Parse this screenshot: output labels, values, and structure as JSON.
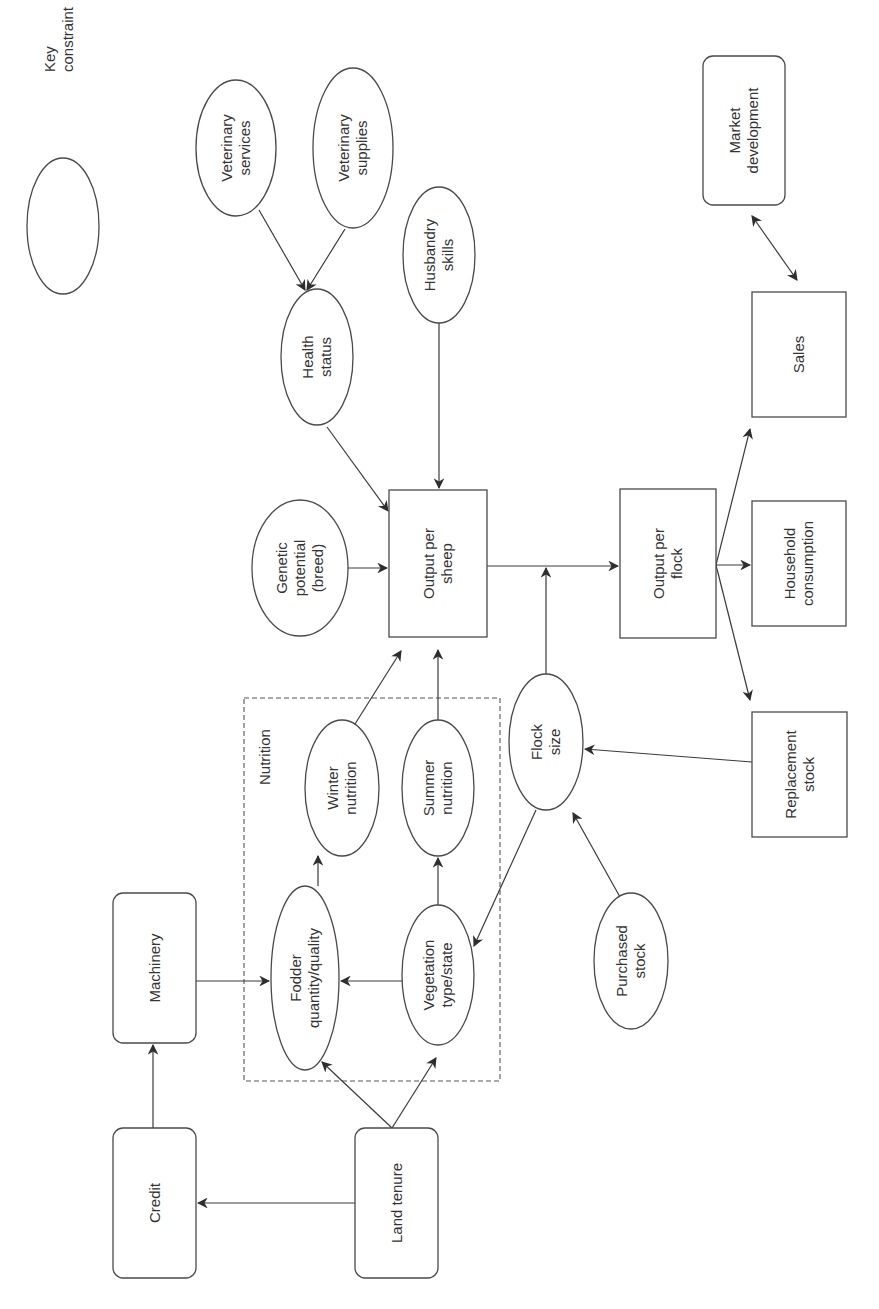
{
  "diagram": {
    "orientation": "rotated -90deg (landscape figure printed on portrait page)",
    "legend": {
      "shape": "ellipse",
      "lines": [
        "Key",
        "constraint"
      ]
    },
    "group": {
      "label": "Nutrition",
      "style": "dashed"
    },
    "nodes": [
      {
        "id": "credit",
        "shape": "roundrect",
        "lines": [
          "Credit"
        ],
        "x": 113,
        "y": 1128,
        "w": 83,
        "h": 150
      },
      {
        "id": "land-tenure",
        "shape": "roundrect",
        "lines": [
          "Land tenure"
        ],
        "x": 355,
        "y": 1128,
        "w": 83,
        "h": 150
      },
      {
        "id": "machinery",
        "shape": "roundrect",
        "lines": [
          "Machinery"
        ],
        "x": 113,
        "y": 893,
        "w": 83,
        "h": 150
      },
      {
        "id": "fodder",
        "shape": "ellipse",
        "lines": [
          "Fodder",
          "quantity/quality"
        ],
        "cx": 305,
        "cy": 978,
        "rx": 34,
        "ry": 92
      },
      {
        "id": "vegetation",
        "shape": "ellipse",
        "lines": [
          "Vegetation",
          "type/state"
        ],
        "cx": 438,
        "cy": 975,
        "rx": 36,
        "ry": 70
      },
      {
        "id": "winter-nutrition",
        "shape": "ellipse",
        "lines": [
          "Winter",
          "nutrition"
        ],
        "cx": 342,
        "cy": 788,
        "rx": 37,
        "ry": 68
      },
      {
        "id": "summer-nutrition",
        "shape": "ellipse",
        "lines": [
          "Summer",
          "nutrition"
        ],
        "cx": 438,
        "cy": 788,
        "rx": 36,
        "ry": 68
      },
      {
        "id": "flock-size",
        "shape": "ellipse",
        "lines": [
          "Flock",
          "size"
        ],
        "cx": 546,
        "cy": 742,
        "rx": 37,
        "ry": 68
      },
      {
        "id": "purchased-stock",
        "shape": "ellipse",
        "lines": [
          "Purchased",
          "stock"
        ],
        "cx": 631,
        "cy": 961,
        "rx": 37,
        "ry": 68
      },
      {
        "id": "replacement-stock",
        "shape": "rect",
        "lines": [
          "Replacement",
          "stock"
        ],
        "x": 752,
        "y": 712,
        "w": 95,
        "h": 125
      },
      {
        "id": "output-per-sheep",
        "shape": "rect",
        "lines": [
          "Output per",
          "sheep"
        ],
        "x": 389,
        "y": 490,
        "w": 98,
        "h": 147
      },
      {
        "id": "genetic-potential",
        "shape": "ellipse",
        "lines": [
          "Genetic",
          "potential",
          "(breed)"
        ],
        "cx": 300,
        "cy": 568,
        "rx": 48,
        "ry": 68
      },
      {
        "id": "health-status",
        "shape": "ellipse",
        "lines": [
          "Health",
          "status"
        ],
        "cx": 317,
        "cy": 357,
        "rx": 36,
        "ry": 68
      },
      {
        "id": "husbandry-skills",
        "shape": "ellipse",
        "lines": [
          "Husbandry",
          "skills"
        ],
        "cx": 439,
        "cy": 255,
        "rx": 36,
        "ry": 68
      },
      {
        "id": "veterinary-services",
        "shape": "ellipse",
        "lines": [
          "Veterinary",
          "services"
        ],
        "cx": 236,
        "cy": 148,
        "rx": 40,
        "ry": 68
      },
      {
        "id": "veterinary-supplies",
        "shape": "ellipse",
        "lines": [
          "Veterinary",
          "supplies"
        ],
        "cx": 353,
        "cy": 148,
        "rx": 40,
        "ry": 80
      },
      {
        "id": "output-per-flock",
        "shape": "rect",
        "lines": [
          "Output per",
          "flock"
        ],
        "x": 620,
        "y": 489,
        "w": 96,
        "h": 149
      },
      {
        "id": "household-consumption",
        "shape": "rect",
        "lines": [
          "Household",
          "consumption"
        ],
        "x": 752,
        "y": 501,
        "w": 94,
        "h": 125
      },
      {
        "id": "sales",
        "shape": "rect",
        "lines": [
          "Sales"
        ],
        "x": 752,
        "y": 292,
        "w": 94,
        "h": 125
      },
      {
        "id": "market-development",
        "shape": "roundrect",
        "lines": [
          "Market",
          "development"
        ],
        "x": 703,
        "y": 56,
        "w": 82,
        "h": 149
      }
    ],
    "edges": [
      {
        "from": "land-tenure",
        "to": "credit"
      },
      {
        "from": "credit",
        "to": "machinery"
      },
      {
        "from": "machinery",
        "to": "fodder"
      },
      {
        "from": "land-tenure",
        "to": "fodder"
      },
      {
        "from": "land-tenure",
        "to": "vegetation"
      },
      {
        "from": "vegetation",
        "to": "fodder"
      },
      {
        "from": "fodder",
        "to": "winter-nutrition"
      },
      {
        "from": "vegetation",
        "to": "summer-nutrition"
      },
      {
        "from": "winter-nutrition",
        "to": "output-per-sheep"
      },
      {
        "from": "summer-nutrition",
        "to": "output-per-sheep"
      },
      {
        "from": "flock-size",
        "to": "vegetation"
      },
      {
        "from": "purchased-stock",
        "to": "flock-size"
      },
      {
        "from": "replacement-stock",
        "to": "flock-size"
      },
      {
        "from": "flock-size",
        "to": "output-per-sheep→output-per-flock line"
      },
      {
        "from": "genetic-potential",
        "to": "output-per-sheep"
      },
      {
        "from": "health-status",
        "to": "output-per-sheep"
      },
      {
        "from": "husbandry-skills",
        "to": "output-per-sheep"
      },
      {
        "from": "veterinary-services",
        "to": "health-status"
      },
      {
        "from": "veterinary-supplies",
        "to": "health-status"
      },
      {
        "from": "output-per-sheep",
        "to": "output-per-flock"
      },
      {
        "from": "output-per-flock",
        "to": "sales"
      },
      {
        "from": "output-per-flock",
        "to": "household-consumption"
      },
      {
        "from": "output-per-flock",
        "to": "replacement-stock"
      },
      {
        "from": "sales",
        "to": "market-development",
        "bidirectional": true
      }
    ]
  }
}
